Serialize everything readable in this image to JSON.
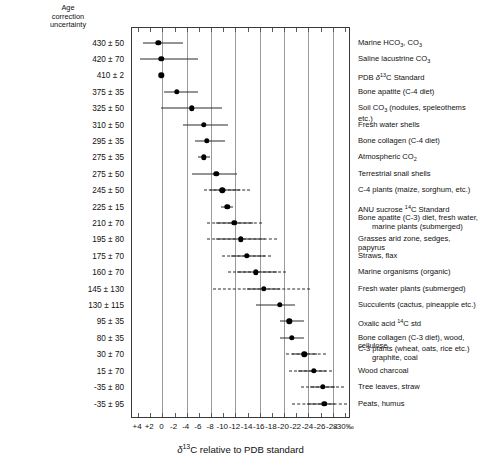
{
  "header": {
    "left_column_title_lines": [
      "Age",
      "correction",
      "uncertainty"
    ]
  },
  "axis": {
    "title_prefix": "δ",
    "title_sup": "13",
    "title_rest": "C relative to PDB standard",
    "title_full": "δ13C relative to PDB standard",
    "tick_labels": [
      "+4",
      "+2",
      "0",
      "-2",
      "-4",
      "-6",
      "-8",
      "-10",
      "-12",
      "-14",
      "-16",
      "-18",
      "-20",
      "-22",
      "-24",
      "-26",
      "-28",
      "-30‰"
    ],
    "tick_values": [
      4,
      2,
      0,
      -2,
      -4,
      -6,
      -8,
      -10,
      -12,
      -14,
      -16,
      -18,
      -20,
      -22,
      -24,
      -26,
      -28,
      -30
    ],
    "gridline_values": [
      0,
      -4,
      -8,
      -12,
      -16,
      -20,
      -24,
      -28
    ],
    "xmin": 5,
    "xmax": -31,
    "unit": "‰"
  },
  "chart_data": {
    "type": "scatter",
    "title": "",
    "xlabel": "δ13C relative to PDB standard",
    "ylabel": "",
    "xlim": [
      5,
      -31
    ],
    "grid": true,
    "legend": "none",
    "orientation": "horizontal-error-bars",
    "rows": [
      {
        "age": "430 ± 50",
        "material": "Marine HCO3, CO3",
        "center": 0.5,
        "low": 3.0,
        "high": -3.5,
        "dash_low": null,
        "dash_high": null
      },
      {
        "age": "420 ± 70",
        "material": "Saline lacustrine CO3",
        "center": 0.0,
        "low": 3.5,
        "high": -6.0,
        "dash_low": null,
        "dash_high": null
      },
      {
        "age": "410 ± 2",
        "material": "PDB δ13C Standard",
        "center": 0.0,
        "low": 0.0,
        "high": 0.0,
        "dash_low": null,
        "dash_high": null
      },
      {
        "age": "375 ± 35",
        "material": "Bone apatite (C-4 diet)",
        "center": -2.5,
        "low": -0.5,
        "high": -6.0,
        "dash_low": null,
        "dash_high": null
      },
      {
        "age": "325 ± 50",
        "material": "Soil CO3 (nodules, speleothems etc.)",
        "center": -5.0,
        "low": 0.0,
        "high": -10.0,
        "dash_low": null,
        "dash_high": null
      },
      {
        "age": "310 ± 50",
        "material": "Fresh water shells",
        "center": -7.0,
        "low": -3.5,
        "high": -11.0,
        "dash_low": null,
        "dash_high": null
      },
      {
        "age": "295 ± 35",
        "material": "Bone collagen (C-4 diet)",
        "center": -7.5,
        "low": -5.5,
        "high": -10.5,
        "dash_low": null,
        "dash_high": null
      },
      {
        "age": "275 ± 35",
        "material": "Atmospheric CO2",
        "center": -7.0,
        "low": -6.0,
        "high": -8.0,
        "dash_low": null,
        "dash_high": null
      },
      {
        "age": "275 ± 50",
        "material": "Terrestrial snail shells",
        "center": -9.0,
        "low": -5.0,
        "high": -12.5,
        "dash_low": null,
        "dash_high": null
      },
      {
        "age": "245 ± 50",
        "material": "C-4 plants (maize, sorghum, etc.)",
        "center": -10.0,
        "low": -8.0,
        "high": -13.0,
        "dash_low": -7.0,
        "dash_high": -14.5
      },
      {
        "age": "225 ± 15",
        "material": "ANU sucrose 14C Standard",
        "center": -10.8,
        "low": -9.8,
        "high": -11.8,
        "dash_low": null,
        "dash_high": null
      },
      {
        "age": "210 ± 70",
        "material": "Bone apatite (C-3) diet, fresh water, marine plants (submerged)",
        "center": -12.0,
        "low": -9.0,
        "high": -15.0,
        "dash_low": -7.5,
        "dash_high": -16.5
      },
      {
        "age": "195 ± 80",
        "material": "Grasses arid zone, sedges, papyrus",
        "center": -13.0,
        "low": -9.0,
        "high": -17.0,
        "dash_low": -7.5,
        "dash_high": -19.0
      },
      {
        "age": "175 ± 70",
        "material": "Straws, flax",
        "center": -14.0,
        "low": -11.5,
        "high": -17.0,
        "dash_low": -10.0,
        "dash_high": -18.0
      },
      {
        "age": "160 ± 70",
        "material": "Marine organisms (organic)",
        "center": -15.5,
        "low": -12.5,
        "high": -19.0,
        "dash_low": -11.0,
        "dash_high": -20.5
      },
      {
        "age": "145 ± 130",
        "material": "Fresh water plants (submerged)",
        "center": -16.8,
        "low": -14.0,
        "high": -19.5,
        "dash_low": -8.5,
        "dash_high": -24.5
      },
      {
        "age": "130 ± 115",
        "material": "Succulents (cactus, pineapple etc.)",
        "center": -19.5,
        "low": -15.5,
        "high": -22.0,
        "dash_low": null,
        "dash_high": null
      },
      {
        "age": "95 ± 35",
        "material": "Oxalic acid 14C std",
        "center": -21.0,
        "low": -19.5,
        "high": -23.5,
        "dash_low": null,
        "dash_high": null
      },
      {
        "age": "80 ± 35",
        "material": "Bone collagen (C-3 diet), wood, cellulose",
        "center": -21.4,
        "low": -19.5,
        "high": -23.5,
        "dash_low": null,
        "dash_high": null
      },
      {
        "age": "30 ± 70",
        "material": "C-3 plants (wheat, oats, rice etc.) graphite, coal",
        "material_line1": "C-3 plants (wheat, oats, rice etc.)",
        "material_line2": "graphite, coal",
        "center": -23.5,
        "low": -21.5,
        "high": -25.5,
        "dash_low": -20.5,
        "dash_high": -27.0
      },
      {
        "age": "15 ± 70",
        "material": "Wood charcoal",
        "center": -25.0,
        "low": -22.5,
        "high": -27.0,
        "dash_low": -21.0,
        "dash_high": -28.0
      },
      {
        "age": "-35 ± 80",
        "material": "Tree leaves, straw",
        "center": -26.5,
        "low": -24.5,
        "high": -28.5,
        "dash_low": -23.0,
        "dash_high": -30.0
      },
      {
        "age": "-35 ± 95",
        "material": "Peats, humus",
        "center": -26.8,
        "low": -24.0,
        "high": -28.5,
        "dash_low": -21.5,
        "dash_high": -30.5
      }
    ]
  },
  "colors": {
    "marker": "#000000",
    "bar": "#2a2a2a",
    "grid": "#9a9a9a",
    "frame": "#3a3a3a",
    "text": "#111111",
    "background": "#ffffff"
  }
}
